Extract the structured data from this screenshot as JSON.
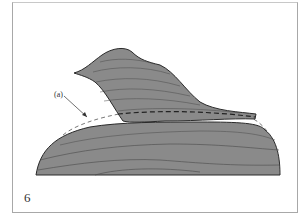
{
  "figure": {
    "number": "6",
    "annotation_label": "(a)"
  },
  "colors": {
    "fill": "#8a8a8a",
    "stroke": "#2a2a2a",
    "layer_line": "#4a4a4a",
    "frame": "#a8a8a8",
    "background": "#ffffff"
  }
}
